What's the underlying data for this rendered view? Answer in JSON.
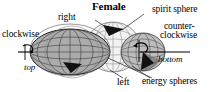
{
  "figure": {
    "title": "Female",
    "labels": {
      "clockwise": "clockwise",
      "right": "right",
      "top": "top",
      "spirit_sphere": "spirit sphere",
      "counter": "counter-",
      "clockwise2": "clockwise",
      "bottom": "bottom",
      "left": "left",
      "energy_spheres": "energy spheres"
    },
    "colors": {
      "ink": "#000000",
      "body_fill": "#a9a9a9",
      "sphere_fill": "#c9c9c9",
      "light_fill": "#ededed",
      "grid": "#555555"
    },
    "icons": {
      "arrow_spirit": "arrowhead-icon",
      "arrow_rotation_left": "arrowhead-icon",
      "arrow_rotation_right": "arrowhead-icon",
      "axis_spin_left": "spin-axis-icon",
      "axis_spin_right": "spin-axis-icon"
    }
  }
}
